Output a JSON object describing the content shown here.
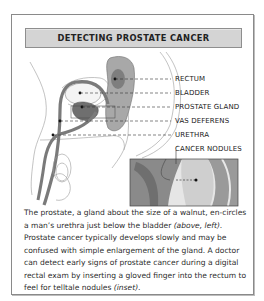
{
  "title": "DETECTING PROSTATE CANCER",
  "labels": [
    {
      "text": "RECTUM",
      "top": 75
    },
    {
      "text": "BLADDER",
      "top": 89
    },
    {
      "text": "PROSTATE GLAND",
      "top": 103
    },
    {
      "text": "VAS DEFERENS",
      "top": 117
    },
    {
      "text": "URETHRA",
      "top": 131
    },
    {
      "text": "CANCER NODULES",
      "top": 145
    }
  ],
  "caption": {
    "part1": "The prostate, a gland about the size of a walnut, en-circles a man’s urethra just below the bladder ",
    "ref1": "(above, left)",
    "part2": ". Prostate cancer typically develops slowly and may be confused with simple enlargement of the gland. A doctor can detect early signs of prostate cancer during a digital rectal exam by inserting a gloved finger into the rectum to feel for telltale nodules ",
    "ref2": "(inset)",
    "part3": "."
  },
  "colors": {
    "title_band": "#d4d4d4",
    "frame_border": "#8a8a8a",
    "organ_dark": "#6f6f6f",
    "organ_mid": "#a8a8a8",
    "organ_light": "#d2d2d2"
  }
}
